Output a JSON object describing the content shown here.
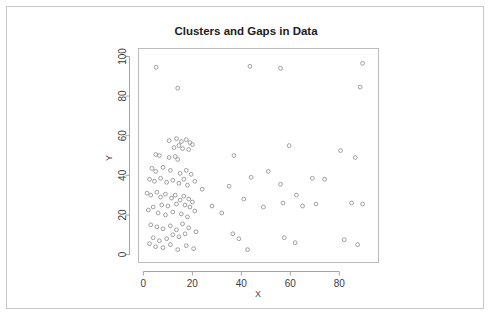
{
  "chart_data": {
    "type": "scatter",
    "title": "Clusters and Gaps in Data",
    "xlabel": "X",
    "ylabel": "Y",
    "xlim": [
      -2,
      96
    ],
    "ylim": [
      -4,
      104
    ],
    "xticks": [
      0,
      20,
      40,
      60,
      80
    ],
    "yticks": [
      0,
      20,
      40,
      60,
      80,
      100
    ],
    "grid": false,
    "legend": null,
    "marker": "open-circle",
    "marker_color": "#8f8f8f",
    "points": [
      [
        5.2,
        94.5
      ],
      [
        43.5,
        95.0
      ],
      [
        89.5,
        96.5
      ],
      [
        14.0,
        84.0
      ],
      [
        56.0,
        94.0
      ],
      [
        88.5,
        84.5
      ],
      [
        10.5,
        57.5
      ],
      [
        13.5,
        58.5
      ],
      [
        15.5,
        57.0
      ],
      [
        17.5,
        58.0
      ],
      [
        19.0,
        56.5
      ],
      [
        20.0,
        55.5
      ],
      [
        16.0,
        53.5
      ],
      [
        18.5,
        53.0
      ],
      [
        12.5,
        54.0
      ],
      [
        14.5,
        55.0
      ],
      [
        5.0,
        50.5
      ],
      [
        6.5,
        50.0
      ],
      [
        10.5,
        49.0
      ],
      [
        13.0,
        49.5
      ],
      [
        14.0,
        48.0
      ],
      [
        37.0,
        50.0
      ],
      [
        59.5,
        55.0
      ],
      [
        86.5,
        49.0
      ],
      [
        3.5,
        43.5
      ],
      [
        5.0,
        42.0
      ],
      [
        8.0,
        44.0
      ],
      [
        11.0,
        42.5
      ],
      [
        15.0,
        41.0
      ],
      [
        17.5,
        42.5
      ],
      [
        19.5,
        40.5
      ],
      [
        2.5,
        38.0
      ],
      [
        4.5,
        37.0
      ],
      [
        7.0,
        38.5
      ],
      [
        9.5,
        36.5
      ],
      [
        12.0,
        37.5
      ],
      [
        14.5,
        36.0
      ],
      [
        16.5,
        38.0
      ],
      [
        18.0,
        35.0
      ],
      [
        21.0,
        37.0
      ],
      [
        24.0,
        33.0
      ],
      [
        35.0,
        34.5
      ],
      [
        44.0,
        39.0
      ],
      [
        51.0,
        42.0
      ],
      [
        56.0,
        35.5
      ],
      [
        62.5,
        30.0
      ],
      [
        69.0,
        38.5
      ],
      [
        74.0,
        38.0
      ],
      [
        80.5,
        52.5
      ],
      [
        1.5,
        31.0
      ],
      [
        3.0,
        30.0
      ],
      [
        5.5,
        31.5
      ],
      [
        7.0,
        29.0
      ],
      [
        9.0,
        30.5
      ],
      [
        11.5,
        28.5
      ],
      [
        13.0,
        30.0
      ],
      [
        15.0,
        27.5
      ],
      [
        16.5,
        29.5
      ],
      [
        18.5,
        28.0
      ],
      [
        20.0,
        26.5
      ],
      [
        17.0,
        25.0
      ],
      [
        19.0,
        24.0
      ],
      [
        13.5,
        25.5
      ],
      [
        10.0,
        24.5
      ],
      [
        7.5,
        25.0
      ],
      [
        4.0,
        24.0
      ],
      [
        2.0,
        22.5
      ],
      [
        6.0,
        21.0
      ],
      [
        9.0,
        20.0
      ],
      [
        12.0,
        21.5
      ],
      [
        15.5,
        20.5
      ],
      [
        18.0,
        19.0
      ],
      [
        21.0,
        22.0
      ],
      [
        28.0,
        24.5
      ],
      [
        32.0,
        21.0
      ],
      [
        41.0,
        28.0
      ],
      [
        49.0,
        24.0
      ],
      [
        57.0,
        26.0
      ],
      [
        65.0,
        24.5
      ],
      [
        70.5,
        25.5
      ],
      [
        85.0,
        26.0
      ],
      [
        89.5,
        25.5
      ],
      [
        3.0,
        15.0
      ],
      [
        5.5,
        14.0
      ],
      [
        8.0,
        13.0
      ],
      [
        11.0,
        14.5
      ],
      [
        13.5,
        12.5
      ],
      [
        16.0,
        15.5
      ],
      [
        18.5,
        13.5
      ],
      [
        21.5,
        11.5
      ],
      [
        12.0,
        10.0
      ],
      [
        14.5,
        9.0
      ],
      [
        17.0,
        10.5
      ],
      [
        4.0,
        8.5
      ],
      [
        6.5,
        7.0
      ],
      [
        9.5,
        8.0
      ],
      [
        2.5,
        5.5
      ],
      [
        5.0,
        4.0
      ],
      [
        8.0,
        3.5
      ],
      [
        11.0,
        5.0
      ],
      [
        14.0,
        2.5
      ],
      [
        17.5,
        4.5
      ],
      [
        20.5,
        3.0
      ],
      [
        36.5,
        10.5
      ],
      [
        39.0,
        8.0
      ],
      [
        42.5,
        2.5
      ],
      [
        57.5,
        8.5
      ],
      [
        62.0,
        6.0
      ],
      [
        82.0,
        7.5
      ],
      [
        87.5,
        5.0
      ]
    ]
  }
}
